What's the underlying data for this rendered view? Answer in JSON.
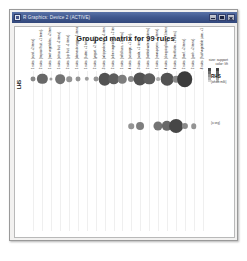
{
  "window": {
    "title": "R Graphics: Device 2 (ACTIVE)",
    "icon": "r-graphics-icon",
    "buttons": {
      "minimize": "Minimize",
      "maximize": "Maximize",
      "close": "Close"
    }
  },
  "plot": {
    "title": "Grouped matrix for 99 rules",
    "lhs_axis_label": "LHS",
    "rhs_axis_label": "RHS",
    "rhs_row1_sub": "{whole milk}",
    "rhs_row2_sub": "{o.veg}"
  },
  "legend": {
    "size_line": "size: support",
    "color_line": "color: lift",
    "size_swatch": "size-scale-bar",
    "color_swatch": "color-scale-bar"
  },
  "chart_data": {
    "type": "scatter",
    "title": "Grouped matrix for 99 rules",
    "xlabel": "LHS",
    "ylabel": "RHS",
    "legend": {
      "size": "support",
      "color": "lift",
      "position": "top-right"
    },
    "grid": true,
    "n_rules": 99,
    "x_categories": [
      "1 rules: {curd, +2 items}",
      "2 rules: {tropical fruit, +1 items}",
      "1 rules: {root vegetables, +2 items}",
      "1 rules: {citrus fruit, +2 items}",
      "2 rules: {pip fruit, +1 items}",
      "1 rules: {domestic eggs, +1 items}",
      "1 rules: {butter, +1 items}",
      "2 rules: {yogurt, +2 items}",
      "3 rules: {whipped cream, +1 items}",
      "2 rules: {other vegetables, +2 items}",
      "1 rules: {rolls/buns, +2 items}",
      "4 rules: {sausage, +1 items}",
      "3 rules: {soda, +1 items}",
      "2 rules: {bottled water, +1 items}",
      "1 rules: {newspapers, +1 items}",
      "4 rules: {shopping bags, +1 items}",
      "6 rules: {frankfurter, +1 items}",
      "2 rules: {beef, +2 items}",
      "2 rules: {pork, +2 items}",
      "8 rules: {fruit/vegetable juice, +1 items}"
    ],
    "y_categories": [
      "{whole milk}",
      "{o.veg}"
    ],
    "points": [
      {
        "x": 0,
        "y": 0,
        "support": 0.013,
        "lift": 2.1
      },
      {
        "x": 1,
        "y": 0,
        "support": 0.022,
        "lift": 2.4
      },
      {
        "x": 2,
        "y": 0,
        "support": 0.01,
        "lift": 1.9
      },
      {
        "x": 3,
        "y": 0,
        "support": 0.021,
        "lift": 2.3
      },
      {
        "x": 4,
        "y": 0,
        "support": 0.014,
        "lift": 2.0
      },
      {
        "x": 5,
        "y": 0,
        "support": 0.013,
        "lift": 2.0
      },
      {
        "x": 6,
        "y": 0,
        "support": 0.012,
        "lift": 1.9
      },
      {
        "x": 7,
        "y": 0,
        "support": 0.013,
        "lift": 2.0
      },
      {
        "x": 8,
        "y": 0,
        "support": 0.026,
        "lift": 2.6
      },
      {
        "x": 9,
        "y": 0,
        "support": 0.024,
        "lift": 2.5
      },
      {
        "x": 10,
        "y": 0,
        "support": 0.019,
        "lift": 2.2
      },
      {
        "x": 11,
        "y": 0,
        "support": 0.015,
        "lift": 2.1
      },
      {
        "x": 12,
        "y": 0,
        "support": 0.027,
        "lift": 2.6
      },
      {
        "x": 13,
        "y": 0,
        "support": 0.024,
        "lift": 2.5
      },
      {
        "x": 14,
        "y": 0,
        "support": 0.011,
        "lift": 1.8
      },
      {
        "x": 15,
        "y": 0,
        "support": 0.026,
        "lift": 2.6
      },
      {
        "x": 16,
        "y": 0,
        "support": 0.016,
        "lift": 2.1
      },
      {
        "x": 17,
        "y": 0,
        "support": 0.031,
        "lift": 2.8
      },
      {
        "x": 11,
        "y": 1,
        "support": 0.014,
        "lift": 2.0
      },
      {
        "x": 12,
        "y": 1,
        "support": 0.018,
        "lift": 2.2
      },
      {
        "x": 14,
        "y": 1,
        "support": 0.02,
        "lift": 2.3
      },
      {
        "x": 15,
        "y": 1,
        "support": 0.022,
        "lift": 2.4
      },
      {
        "x": 16,
        "y": 1,
        "support": 0.028,
        "lift": 2.7
      },
      {
        "x": 17,
        "y": 1,
        "support": 0.015,
        "lift": 2.1
      },
      {
        "x": 18,
        "y": 1,
        "support": 0.014,
        "lift": 2.0
      }
    ]
  }
}
